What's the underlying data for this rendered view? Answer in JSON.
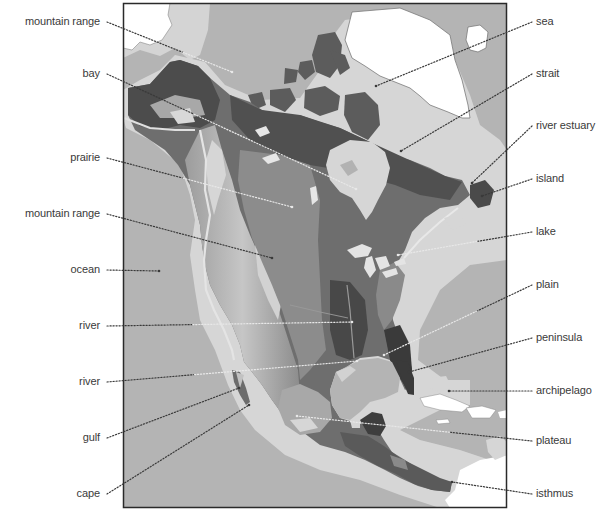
{
  "diagram": {
    "type": "labeled-relief-map",
    "colors": {
      "ocean": "#b4b4b4",
      "shelf": "#d8d8d8",
      "ice": "#ffffff",
      "lowland": "#5a5a5a",
      "midland": "#8a8a8a",
      "highland": "#c8c8c8",
      "dark_land": "#3e3e3e",
      "frame": "#2a2a2a",
      "leader_dark": "#3a3a3a",
      "leader_light": "#e8e8e8",
      "label_text": "#3a3a3a"
    }
  },
  "labels_left": [
    {
      "id": "mountain-range-1",
      "text": "mountain range",
      "x": 103,
      "y": 22,
      "target": [
        232,
        72
      ],
      "leader": "dark-then-light"
    },
    {
      "id": "bay",
      "text": "bay",
      "x": 103,
      "y": 74,
      "target": [
        356,
        189
      ],
      "leader": "dark-then-light"
    },
    {
      "id": "prairie",
      "text": "prairie",
      "x": 103,
      "y": 158,
      "target": [
        292,
        207
      ],
      "leader": "dark-then-light"
    },
    {
      "id": "mountain-range-2",
      "text": "mountain range",
      "x": 103,
      "y": 214,
      "target": [
        272,
        258
      ],
      "leader": "dark"
    },
    {
      "id": "ocean",
      "text": "ocean",
      "x": 103,
      "y": 270,
      "target": [
        159,
        271
      ],
      "leader": "dark"
    },
    {
      "id": "river-1",
      "text": "river",
      "x": 103,
      "y": 326,
      "target": [
        352,
        322
      ],
      "leader": "dark-then-light"
    },
    {
      "id": "river-2",
      "text": "river",
      "x": 103,
      "y": 382,
      "target": [
        357,
        361
      ],
      "leader": "dark-then-light"
    },
    {
      "id": "gulf",
      "text": "gulf",
      "x": 103,
      "y": 438,
      "target": [
        239,
        388
      ],
      "leader": "dark"
    },
    {
      "id": "cape",
      "text": "cape",
      "x": 103,
      "y": 494,
      "target": [
        249,
        405
      ],
      "leader": "dark"
    }
  ],
  "labels_right": [
    {
      "id": "sea",
      "text": "sea",
      "x": 536,
      "y": 22,
      "target": [
        376,
        86
      ],
      "leader": "dark"
    },
    {
      "id": "strait",
      "text": "strait",
      "x": 536,
      "y": 74,
      "target": [
        401,
        151
      ],
      "leader": "dark"
    },
    {
      "id": "river-estuary",
      "text": "river estuary",
      "x": 536,
      "y": 126,
      "target": [
        472,
        183
      ],
      "leader": "dark"
    },
    {
      "id": "island",
      "text": "island",
      "x": 536,
      "y": 179,
      "target": [
        482,
        196
      ],
      "leader": "dark"
    },
    {
      "id": "lake",
      "text": "lake",
      "x": 536,
      "y": 232,
      "target": [
        398,
        255
      ],
      "leader": "dark-then-light"
    },
    {
      "id": "plain",
      "text": "plain",
      "x": 536,
      "y": 285,
      "target": [
        384,
        355
      ],
      "leader": "dark-then-light"
    },
    {
      "id": "peninsula",
      "text": "peninsula",
      "x": 536,
      "y": 338,
      "target": [
        409,
        372
      ],
      "leader": "dark"
    },
    {
      "id": "archipelago",
      "text": "archipelago",
      "x": 536,
      "y": 391,
      "target": [
        449,
        391
      ],
      "leader": "dark"
    },
    {
      "id": "plateau",
      "text": "plateau",
      "x": 536,
      "y": 441,
      "target": [
        297,
        416
      ],
      "leader": "dark-then-light"
    },
    {
      "id": "isthmus",
      "text": "isthmus",
      "x": 536,
      "y": 494,
      "target": [
        452,
        482
      ],
      "leader": "dark"
    }
  ],
  "map_frame": {
    "x": 123,
    "y": 3,
    "width": 384,
    "height": 505
  }
}
